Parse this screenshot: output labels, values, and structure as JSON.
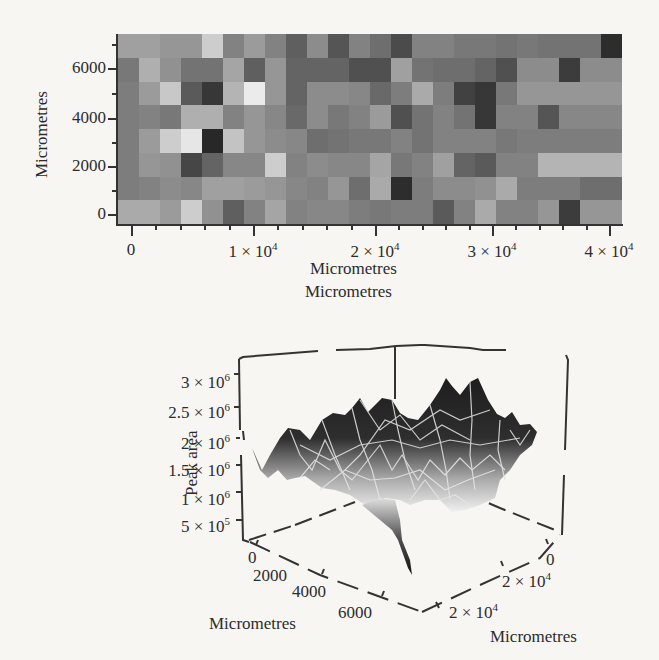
{
  "chart_data": [
    {
      "type": "heatmap",
      "title": "",
      "xlabel": "Micrometres",
      "ylabel": "Micrometres",
      "x_ticks": [
        "0",
        "1 × 10^4",
        "2 × 10^4",
        "3 × 10^4",
        "4 × 10^4"
      ],
      "y_ticks": [
        "0",
        "2000",
        "4000",
        "6000"
      ],
      "xlim": [
        -1000,
        48000
      ],
      "ylim": [
        -500,
        7000
      ],
      "colormap": "grayscale (darker = higher peak area)",
      "rows": 8,
      "cols": 24,
      "gray_values_top_to_bottom": [
        [
          160,
          160,
          150,
          150,
          205,
          130,
          155,
          130,
          95,
          140,
          85,
          130,
          110,
          75,
          130,
          130,
          120,
          120,
          115,
          120,
          115,
          115,
          115,
          45
        ],
        [
          120,
          175,
          145,
          115,
          115,
          165,
          95,
          150,
          100,
          100,
          100,
          80,
          80,
          160,
          115,
          110,
          110,
          100,
          80,
          140,
          140,
          60,
          140,
          140
        ],
        [
          125,
          155,
          200,
          90,
          55,
          180,
          235,
          150,
          100,
          140,
          140,
          135,
          105,
          125,
          170,
          125,
          65,
          55,
          120,
          150,
          150,
          150,
          150,
          150
        ],
        [
          125,
          130,
          120,
          175,
          175,
          130,
          150,
          135,
          105,
          140,
          120,
          130,
          155,
          80,
          115,
          130,
          115,
          55,
          130,
          130,
          85,
          135,
          135,
          135
        ],
        [
          125,
          155,
          205,
          230,
          40,
          195,
          150,
          140,
          135,
          110,
          115,
          120,
          120,
          130,
          115,
          130,
          130,
          130,
          120,
          125,
          125,
          125,
          125,
          125
        ],
        [
          125,
          150,
          145,
          70,
          100,
          135,
          135,
          205,
          130,
          140,
          135,
          135,
          165,
          120,
          130,
          160,
          100,
          90,
          130,
          130,
          180,
          180,
          180,
          180
        ],
        [
          125,
          130,
          140,
          135,
          160,
          160,
          155,
          150,
          135,
          130,
          150,
          110,
          170,
          45,
          125,
          140,
          140,
          145,
          170,
          125,
          125,
          125,
          110,
          110
        ],
        [
          170,
          170,
          155,
          205,
          145,
          95,
          130,
          165,
          130,
          135,
          135,
          125,
          120,
          125,
          125,
          90,
          130,
          170,
          130,
          130,
          150,
          60,
          150,
          150
        ]
      ]
    },
    {
      "type": "surface3d",
      "title": "",
      "zlabel": "Peak area",
      "xlabel": "Micrometres",
      "ylabel": "Micrometres",
      "z_ticks": [
        "5 × 10^5",
        "1 × 10^6",
        "1.5 × 10^6",
        "2 × 10^6",
        "2.5 × 10^6",
        "3 × 10^6"
      ],
      "y_ticks": [
        "0",
        "2000",
        "4000",
        "6000"
      ],
      "x_ticks": [
        "0",
        "2 × 10^4",
        "2 × 10^4"
      ],
      "zlim": [
        300000,
        3200000
      ],
      "description": "Jagged surface of peak area over the sample grid, shaded dark at high values to light at low, with white mesh lines"
    }
  ],
  "heatmap": {
    "y_axis_title": "Micrometres",
    "x_axis_title": "Micrometres",
    "y_ticks": [
      {
        "label": "6000",
        "y": 68
      },
      {
        "label": "4000",
        "y": 118
      },
      {
        "label": "2000",
        "y": 166
      },
      {
        "label": "0",
        "y": 214
      }
    ],
    "x_ticks": [
      {
        "base": "0",
        "exp": "",
        "x": 131
      },
      {
        "base": "1 × 10",
        "exp": "4",
        "x": 253
      },
      {
        "base": "2 × 10",
        "exp": "4",
        "x": 375
      },
      {
        "base": "3 × 10",
        "exp": "4",
        "x": 492
      },
      {
        "base": "4 × 10",
        "exp": "4",
        "x": 609
      }
    ]
  },
  "surface": {
    "z_axis_title": "Peak area",
    "top_axis_title": "Micrometres",
    "left_axis_title": "Micrometres",
    "right_axis_title": "Micrometres",
    "z_ticks": [
      {
        "base": "3 × 10",
        "exp": "6",
        "y": 383
      },
      {
        "base": "2.5 × 10",
        "exp": "6",
        "y": 413
      },
      {
        "base": "2 × 10",
        "exp": "6",
        "y": 444
      },
      {
        "base": "1.5 × 10",
        "exp": "6",
        "y": 471
      },
      {
        "base": "1 × 10",
        "exp": "6",
        "y": 500
      },
      {
        "base": "5 × 10",
        "exp": "5",
        "y": 527
      }
    ],
    "y_ticks": [
      "0",
      "2000",
      "4000",
      "6000"
    ],
    "x_ticks": [
      {
        "base": "0",
        "exp": ""
      },
      {
        "base": "2 × 10",
        "exp": "4"
      },
      {
        "base": "2 × 10",
        "exp": "4"
      }
    ]
  }
}
